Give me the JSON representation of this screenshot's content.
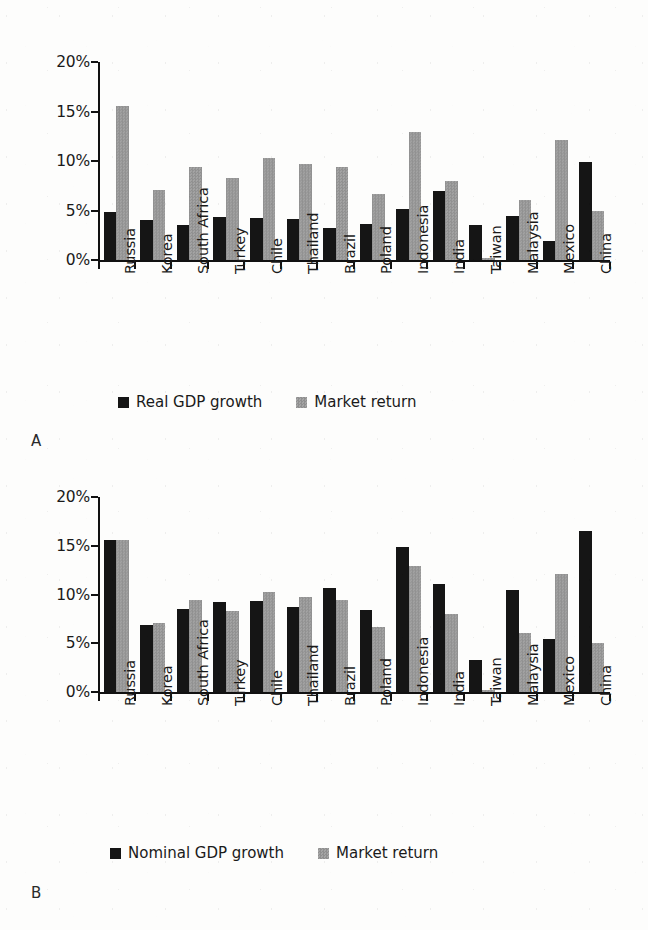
{
  "figure": {
    "panel_a_letter": "A",
    "panel_b_letter": "B"
  },
  "chart_data": [
    {
      "type": "bar",
      "panel": "A",
      "title": "",
      "xlabel": "",
      "ylabel": "",
      "ylim": [
        0,
        20
      ],
      "ytick_labels": [
        "0%",
        "5%",
        "10%",
        "15%",
        "20%"
      ],
      "ytick_values": [
        0,
        5,
        10,
        15,
        20
      ],
      "grid": false,
      "legend_position": "bottom",
      "categories": [
        "Russia",
        "Korea",
        "South Africa",
        "Turkey",
        "Chile",
        "Thailand",
        "Brazil",
        "Poland",
        "Indonesia",
        "India",
        "Taiwan",
        "Malaysia",
        "Mexico",
        "China"
      ],
      "series": [
        {
          "name": "Real GDP growth",
          "color": "#151515",
          "values": [
            4.8,
            4.0,
            3.5,
            4.3,
            4.2,
            4.1,
            3.2,
            3.6,
            5.2,
            7.0,
            3.5,
            4.4,
            1.9,
            9.9
          ]
        },
        {
          "name": "Market return",
          "color": "#9a9a9a",
          "values": [
            15.6,
            7.1,
            9.4,
            8.3,
            10.3,
            9.7,
            9.4,
            6.7,
            12.9,
            8.0,
            0.2,
            6.1,
            12.1,
            5.0
          ]
        }
      ]
    },
    {
      "type": "bar",
      "panel": "B",
      "title": "",
      "xlabel": "",
      "ylabel": "",
      "ylim": [
        0,
        20
      ],
      "ytick_labels": [
        "0%",
        "5%",
        "10%",
        "15%",
        "20%"
      ],
      "ytick_values": [
        0,
        5,
        10,
        15,
        20
      ],
      "grid": false,
      "legend_position": "bottom",
      "categories": [
        "Russia",
        "Korea",
        "South Africa",
        "Turkey",
        "Chile",
        "Thailand",
        "Brazil",
        "Poland",
        "Indonesia",
        "India",
        "Taiwan",
        "Malaysia",
        "Mexico",
        "China"
      ],
      "series": [
        {
          "name": "Nominal GDP growth",
          "color": "#151515",
          "values": [
            15.6,
            6.9,
            8.5,
            9.2,
            9.3,
            8.7,
            10.7,
            8.4,
            14.9,
            11.1,
            3.3,
            10.5,
            5.4,
            16.5
          ]
        },
        {
          "name": "Market return",
          "color": "#9a9a9a",
          "values": [
            15.6,
            7.1,
            9.4,
            8.3,
            10.3,
            9.7,
            9.4,
            6.7,
            12.9,
            8.0,
            0.2,
            6.1,
            12.1,
            5.0
          ]
        }
      ]
    }
  ]
}
